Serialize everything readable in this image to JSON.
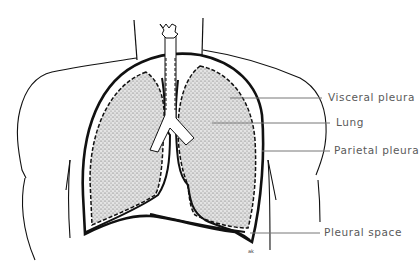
{
  "diagram": {
    "type": "anatomical-illustration",
    "labels": [
      {
        "id": "visceral-pleura",
        "text": "Visceral pleura"
      },
      {
        "id": "lung",
        "text": "Lung"
      },
      {
        "id": "parietal-pleura",
        "text": "Parietal pleura"
      },
      {
        "id": "pleural-space",
        "text": "Pleural space"
      }
    ]
  },
  "colors": {
    "ink": "#111111",
    "label_text": "#5a5a5a",
    "leader_line": "#777777",
    "lung_fill": "#d8d8d8",
    "background": "#ffffff"
  }
}
